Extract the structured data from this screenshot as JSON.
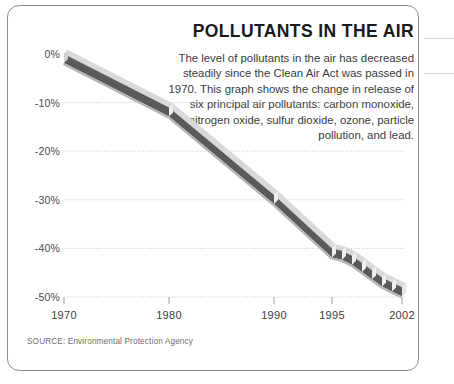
{
  "headline": "POLLUTANTS IN THE AIR",
  "deck": "The level of pollutants in the air has decreased steadily since the Clean Air Act was passed in 1970. This graph shows the change in release of six principal air pollutants: carbon monoxide, nitrogen oxide, sulfur dioxide, ozone, particle pollution, and lead.",
  "source": "SOURCE: Environmental Protection Agency",
  "colors": {
    "ribbon_face": "#5a5a5a",
    "ribbon_highlight": "#d9d9d9",
    "ribbon_shadow": "#b4b4b4",
    "gridline": "#b9b9b9",
    "border": "#8e8e8e",
    "text": "#3b3b3b",
    "background": "#ffffff"
  },
  "chart_data": {
    "type": "line",
    "title": "POLLUTANTS IN THE AIR",
    "xlabel": "",
    "ylabel": "",
    "ylim": [
      -50,
      0
    ],
    "xlim": [
      1970,
      2002
    ],
    "grid": true,
    "legend": null,
    "ytick_labels": [
      "0%",
      "-10%",
      "-20%",
      "-30%",
      "-40%",
      "-50%"
    ],
    "ytick_values": [
      0,
      -10,
      -20,
      -30,
      -40,
      -50
    ],
    "xtick_labels": [
      "1970",
      "1980",
      "1990",
      "1995",
      "2002"
    ],
    "xtick_values": [
      1970,
      1980,
      1990,
      1995,
      2002
    ],
    "series": [
      {
        "name": "Change in release of six principal air pollutants",
        "x": [
          1970,
          1980,
          1990,
          1995,
          1996,
          1997,
          1998,
          1999,
          2000,
          2001,
          2002
        ],
        "values": [
          0,
          -11,
          -29,
          -40,
          -40.5,
          -41.5,
          -43,
          -44.5,
          -46,
          -47,
          -48
        ]
      }
    ]
  }
}
